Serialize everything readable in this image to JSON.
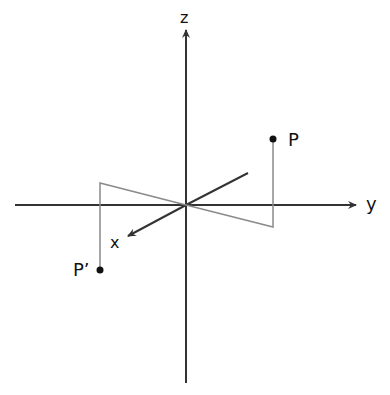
{
  "diagram": {
    "axes": {
      "z_label": "z",
      "y_label": "y",
      "x_label": "x"
    },
    "points": {
      "P_label": "P",
      "P_prime_label": "P’"
    },
    "colors": {
      "axis": "#333333",
      "construction": "#8a8a8a",
      "point": "#111111",
      "background": "#ffffff"
    }
  }
}
